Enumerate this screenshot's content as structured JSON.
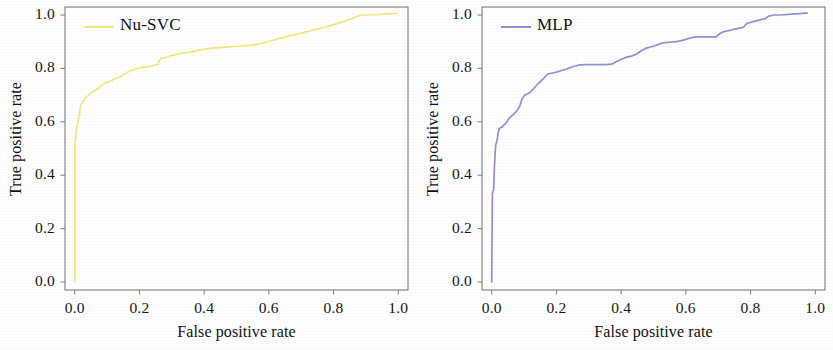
{
  "figure": {
    "background_color": "#ffffff",
    "panel_count": 2
  },
  "chart_data": [
    {
      "type": "line",
      "title": "",
      "legend": [
        "Nu-SVC"
      ],
      "legend_position": "top-left",
      "legend_color": "#EFEA7C",
      "xlabel": "False positive rate",
      "ylabel": "True positive rate",
      "xlim": [
        -0.03,
        1.03
      ],
      "ylim": [
        -0.03,
        1.03
      ],
      "xticks": [
        "0.0",
        "0.2",
        "0.4",
        "0.6",
        "0.8",
        "1.0"
      ],
      "yticks": [
        "0.0",
        "0.2",
        "0.4",
        "0.6",
        "0.8",
        "1.0"
      ],
      "xtick_values": [
        0.0,
        0.2,
        0.4,
        0.6,
        0.8,
        1.0
      ],
      "ytick_values": [
        0.0,
        0.2,
        0.4,
        0.6,
        0.8,
        1.0
      ],
      "grid": false,
      "series": [
        {
          "name": "Nu-SVC",
          "color": "#EFEA7C",
          "x": [
            0.0,
            0.0,
            0.002,
            0.004,
            0.006,
            0.008,
            0.01,
            0.012,
            0.014,
            0.016,
            0.018,
            0.022,
            0.026,
            0.03,
            0.034,
            0.04,
            0.046,
            0.052,
            0.06,
            0.068,
            0.078,
            0.088,
            0.098,
            0.11,
            0.122,
            0.134,
            0.146,
            0.158,
            0.17,
            0.182,
            0.196,
            0.21,
            0.224,
            0.24,
            0.256,
            0.262,
            0.268,
            0.284,
            0.3,
            0.32,
            0.34,
            0.36,
            0.382,
            0.402,
            0.424,
            0.446,
            0.468,
            0.492,
            0.516,
            0.54,
            0.556,
            0.572,
            0.596,
            0.62,
            0.646,
            0.672,
            0.7,
            0.726,
            0.752,
            0.778,
            0.806,
            0.832,
            0.856,
            0.874,
            0.886,
            0.9,
            0.92,
            0.944,
            0.966,
            0.988,
            0.995
          ],
          "y": [
            0.0,
            0.52,
            0.525,
            0.56,
            0.575,
            0.59,
            0.6,
            0.612,
            0.625,
            0.64,
            0.662,
            0.672,
            0.676,
            0.682,
            0.69,
            0.696,
            0.702,
            0.71,
            0.716,
            0.722,
            0.73,
            0.74,
            0.748,
            0.752,
            0.76,
            0.766,
            0.772,
            0.782,
            0.79,
            0.796,
            0.8,
            0.804,
            0.806,
            0.81,
            0.814,
            0.83,
            0.838,
            0.842,
            0.848,
            0.854,
            0.858,
            0.862,
            0.868,
            0.872,
            0.876,
            0.878,
            0.88,
            0.882,
            0.884,
            0.886,
            0.888,
            0.892,
            0.9,
            0.908,
            0.916,
            0.924,
            0.932,
            0.94,
            0.948,
            0.956,
            0.966,
            0.976,
            0.986,
            0.996,
            1.0,
            1.0,
            1.0,
            1.002,
            1.004,
            1.006,
            1.006
          ]
        }
      ]
    },
    {
      "type": "line",
      "title": "",
      "legend": [
        "MLP"
      ],
      "legend_position": "top-left",
      "legend_color": "#9090D8",
      "xlabel": "False positive rate",
      "ylabel": "True positive rate",
      "xlim": [
        -0.03,
        1.03
      ],
      "ylim": [
        -0.03,
        1.03
      ],
      "xticks": [
        "0.0",
        "0.2",
        "0.4",
        "0.6",
        "0.8",
        "1.0"
      ],
      "yticks": [
        "0.0",
        "0.2",
        "0.4",
        "0.6",
        "0.8",
        "1.0"
      ],
      "xtick_values": [
        0.0,
        0.2,
        0.4,
        0.6,
        0.8,
        1.0
      ],
      "ytick_values": [
        0.0,
        0.2,
        0.4,
        0.6,
        0.8,
        1.0
      ],
      "grid": false,
      "series": [
        {
          "name": "MLP",
          "color": "#9090D8",
          "x": [
            0.0,
            0.0,
            0.002,
            0.004,
            0.006,
            0.008,
            0.01,
            0.012,
            0.014,
            0.016,
            0.018,
            0.02,
            0.024,
            0.028,
            0.032,
            0.036,
            0.042,
            0.048,
            0.054,
            0.06,
            0.066,
            0.072,
            0.078,
            0.086,
            0.094,
            0.102,
            0.11,
            0.118,
            0.128,
            0.138,
            0.148,
            0.16,
            0.172,
            0.184,
            0.2,
            0.216,
            0.232,
            0.25,
            0.268,
            0.286,
            0.306,
            0.33,
            0.352,
            0.372,
            0.386,
            0.4,
            0.416,
            0.432,
            0.448,
            0.462,
            0.478,
            0.496,
            0.512,
            0.528,
            0.548,
            0.57,
            0.592,
            0.614,
            0.63,
            0.65,
            0.672,
            0.694,
            0.704,
            0.718,
            0.74,
            0.762,
            0.778,
            0.788,
            0.804,
            0.824,
            0.844,
            0.856,
            0.872,
            0.892,
            0.914,
            0.938,
            0.96,
            0.975
          ],
          "y": [
            0.0,
            0.012,
            0.33,
            0.338,
            0.346,
            0.42,
            0.47,
            0.51,
            0.52,
            0.528,
            0.54,
            0.56,
            0.576,
            0.578,
            0.58,
            0.586,
            0.592,
            0.602,
            0.614,
            0.62,
            0.626,
            0.634,
            0.642,
            0.656,
            0.686,
            0.7,
            0.704,
            0.71,
            0.722,
            0.736,
            0.748,
            0.762,
            0.778,
            0.782,
            0.786,
            0.792,
            0.798,
            0.806,
            0.812,
            0.814,
            0.814,
            0.814,
            0.814,
            0.816,
            0.826,
            0.834,
            0.842,
            0.846,
            0.854,
            0.866,
            0.876,
            0.882,
            0.888,
            0.896,
            0.898,
            0.9,
            0.906,
            0.914,
            0.918,
            0.918,
            0.918,
            0.918,
            0.93,
            0.938,
            0.944,
            0.95,
            0.954,
            0.968,
            0.974,
            0.98,
            0.986,
            0.996,
            1.0,
            1.0,
            1.002,
            1.004,
            1.006,
            1.008
          ]
        }
      ]
    }
  ],
  "panels": [
    {
      "id": "nu-svc",
      "legend_label": "Nu-SVC",
      "legend_color": "#EFEA7C",
      "xlabel": "False positive rate",
      "ylabel": "True positive rate",
      "xticks": [
        "0.0",
        "0.2",
        "0.4",
        "0.6",
        "0.8",
        "1.0"
      ],
      "yticks": [
        "0.0",
        "0.2",
        "0.4",
        "0.6",
        "0.8",
        "1.0"
      ]
    },
    {
      "id": "mlp",
      "legend_label": "MLP",
      "legend_color": "#9090D8",
      "xlabel": "False positive rate",
      "ylabel": "True positive rate",
      "xticks": [
        "0.0",
        "0.2",
        "0.4",
        "0.6",
        "0.8",
        "1.0"
      ],
      "yticks": [
        "0.0",
        "0.2",
        "0.4",
        "0.6",
        "0.8",
        "1.0"
      ]
    }
  ]
}
